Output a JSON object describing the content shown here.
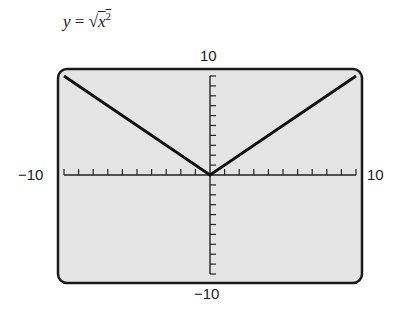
{
  "equation": {
    "lhs": "y",
    "equals": "=",
    "radical": "√",
    "radicand": "x",
    "exponent": "2"
  },
  "labels": {
    "ymax": "10",
    "ymin": "−10",
    "xmin": "−10",
    "xmax": "10"
  },
  "chart_data": {
    "type": "line",
    "xlabel": "",
    "ylabel": "",
    "xlim": [
      -10,
      10
    ],
    "ylim": [
      -10,
      10
    ],
    "xscale_ticks": 1,
    "yscale_ticks": 1,
    "grid": false,
    "series": [
      {
        "name": "y = sqrt(x^2)",
        "x": [
          -10,
          0,
          10
        ],
        "y": [
          10,
          0,
          10
        ]
      }
    ],
    "frame_color": "#1a1a1a",
    "background_color": "#e4e4e4",
    "line_color": "#111111"
  }
}
